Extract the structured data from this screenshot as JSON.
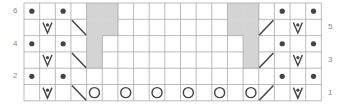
{
  "chart_data": {
    "type": "knitting-chart",
    "columns": 19,
    "rows": 6,
    "row_labels_left": [
      "6",
      "4",
      "2"
    ],
    "row_labels_right": [
      "5",
      "3",
      "1"
    ],
    "grid": [
      [
        "dot",
        "",
        "dot",
        "",
        "grey",
        "grey",
        "",
        "",
        "",
        "",
        "",
        "",
        "",
        "grey",
        "grey",
        "",
        "dot",
        "",
        "dot"
      ],
      [
        "",
        "vdot",
        "",
        "bslash",
        "grey",
        "grey",
        "",
        "",
        "",
        "",
        "",
        "",
        "",
        "grey",
        "grey",
        "slash",
        "",
        "vdot",
        ""
      ],
      [
        "dot",
        "",
        "dot",
        "",
        "grey",
        "",
        "",
        "",
        "",
        "",
        "",
        "",
        "",
        "",
        "grey",
        "",
        "dot",
        "",
        "dot"
      ],
      [
        "",
        "vdot",
        "",
        "bslash",
        "grey",
        "",
        "",
        "",
        "",
        "",
        "",
        "",
        "",
        "",
        "grey",
        "slash",
        "",
        "vdot",
        ""
      ],
      [
        "dot",
        "",
        "dot",
        "",
        "",
        "",
        "",
        "",
        "",
        "",
        "",
        "",
        "",
        "",
        "",
        "",
        "dot",
        "",
        "dot"
      ],
      [
        "",
        "vdot",
        "",
        "bslash",
        "yo",
        "",
        "yo",
        "",
        "yo",
        "",
        "yo",
        "",
        "yo",
        "",
        "yo",
        "slash",
        "",
        "vdot",
        ""
      ]
    ],
    "legend_symbols": {
      "dot": "purl",
      "vdot": "slip stitch with dot",
      "bslash": "decrease left-leaning",
      "slash": "decrease right-leaning",
      "yo": "yarn over",
      "grey": "no stitch"
    }
  },
  "colors": {
    "grid_line": "#aaaaaa",
    "grey_cell": "#d4d4d4",
    "symbol": "#444444",
    "label": "#888888"
  }
}
